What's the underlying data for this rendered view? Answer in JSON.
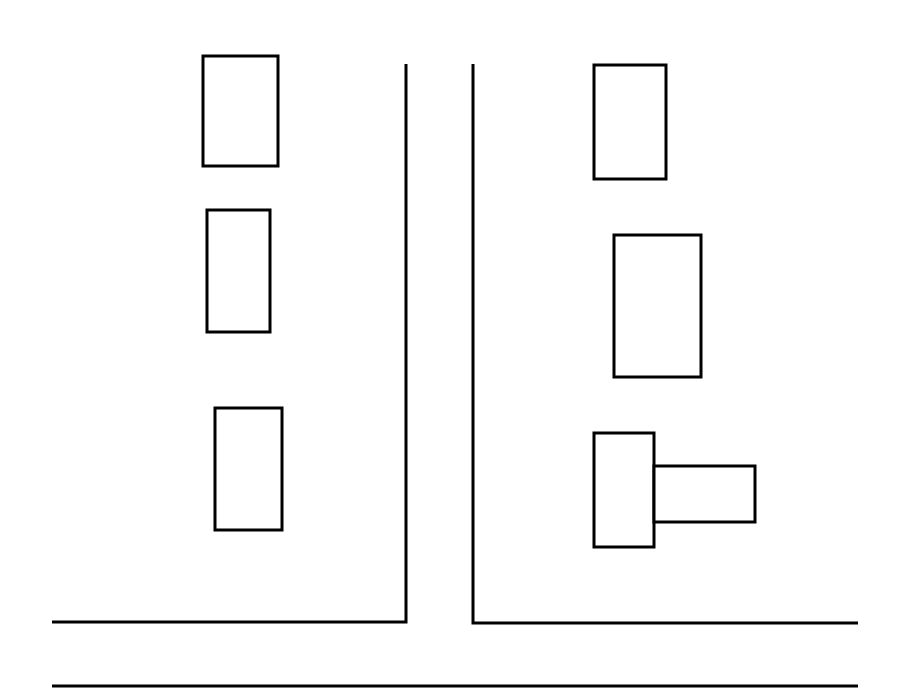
{
  "diagram": {
    "type": "street-layout-sketch",
    "stroke_color": "#000000",
    "background": "#ffffff",
    "buildings": [
      {
        "id": "left-1",
        "x": 203,
        "y": 56,
        "w": 75,
        "h": 110
      },
      {
        "id": "left-2",
        "x": 207,
        "y": 210,
        "w": 63,
        "h": 122
      },
      {
        "id": "left-3",
        "x": 215,
        "y": 408,
        "w": 67,
        "h": 122
      },
      {
        "id": "right-1",
        "x": 594,
        "y": 65,
        "w": 72,
        "h": 114
      },
      {
        "id": "right-2",
        "x": 614,
        "y": 235,
        "w": 87,
        "h": 142
      },
      {
        "id": "right-3-main",
        "x": 594,
        "y": 433,
        "w": 60,
        "h": 114
      },
      {
        "id": "right-3-annex",
        "x": 654,
        "y": 466,
        "w": 101,
        "h": 56
      }
    ],
    "roads": [
      {
        "id": "left-curb",
        "points": "52,622 406,622 406,64"
      },
      {
        "id": "right-curb",
        "points": "473,64 473,623 858,623"
      },
      {
        "id": "bottom-curb",
        "points": "52,686 858,686"
      }
    ]
  }
}
